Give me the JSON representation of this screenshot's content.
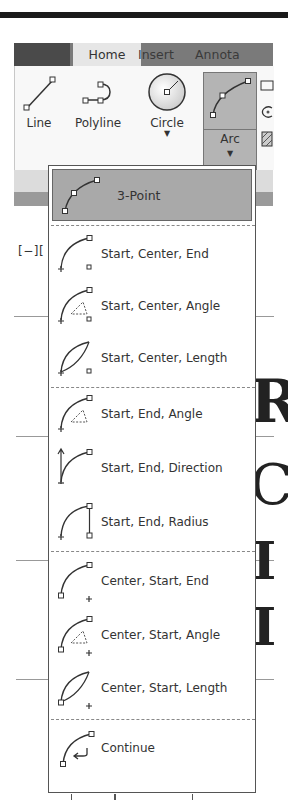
{
  "ribbon": {
    "tabs": [
      {
        "label": "",
        "state": "dark"
      },
      {
        "label": "Home",
        "state": "active"
      },
      {
        "label": "Insert",
        "state": "inactive"
      },
      {
        "label": "Annota",
        "state": "inactive"
      }
    ],
    "draw_panel": {
      "buttons": [
        {
          "label": "Line",
          "icon": "line-icon",
          "has_dropdown": false
        },
        {
          "label": "Polyline",
          "icon": "polyline-icon",
          "has_dropdown": false
        },
        {
          "label": "Circle",
          "icon": "circle-icon",
          "has_dropdown": true
        },
        {
          "label": "Arc",
          "icon": "arc-icon",
          "has_dropdown": true,
          "state": "pressed"
        }
      ],
      "side_icons": [
        "rectangle-icon",
        "ellipse-icon",
        "hatch-icon"
      ]
    }
  },
  "viewport": {
    "label": "[−][",
    "background_text": [
      "R",
      "C",
      "I",
      "I"
    ]
  },
  "arc_menu": {
    "items": [
      {
        "label": "3-Point",
        "icon": "arc-3point-icon",
        "selected": true
      },
      {
        "label": "Start, Center, End",
        "icon": "arc-start-center-end-icon"
      },
      {
        "label": "Start, Center, Angle",
        "icon": "arc-start-center-angle-icon"
      },
      {
        "label": "Start, Center, Length",
        "icon": "arc-start-center-length-icon"
      },
      {
        "label": "Start, End, Angle",
        "icon": "arc-start-end-angle-icon"
      },
      {
        "label": "Start, End, Direction",
        "icon": "arc-start-end-direction-icon"
      },
      {
        "label": "Start, End, Radius",
        "icon": "arc-start-end-radius-icon"
      },
      {
        "label": "Center, Start, End",
        "icon": "arc-center-start-end-icon"
      },
      {
        "label": "Center, Start, Angle",
        "icon": "arc-center-start-angle-icon"
      },
      {
        "label": "Center, Start, Length",
        "icon": "arc-center-start-length-icon"
      },
      {
        "label": "Continue",
        "icon": "arc-continue-icon"
      }
    ]
  },
  "colors": {
    "menu_selected_bg": "#a9a9a9",
    "arc_button_bg": "#b4b4b4",
    "tab_bar_bg": "#7a7a7a",
    "active_tab_bg": "#e6e6e6"
  }
}
